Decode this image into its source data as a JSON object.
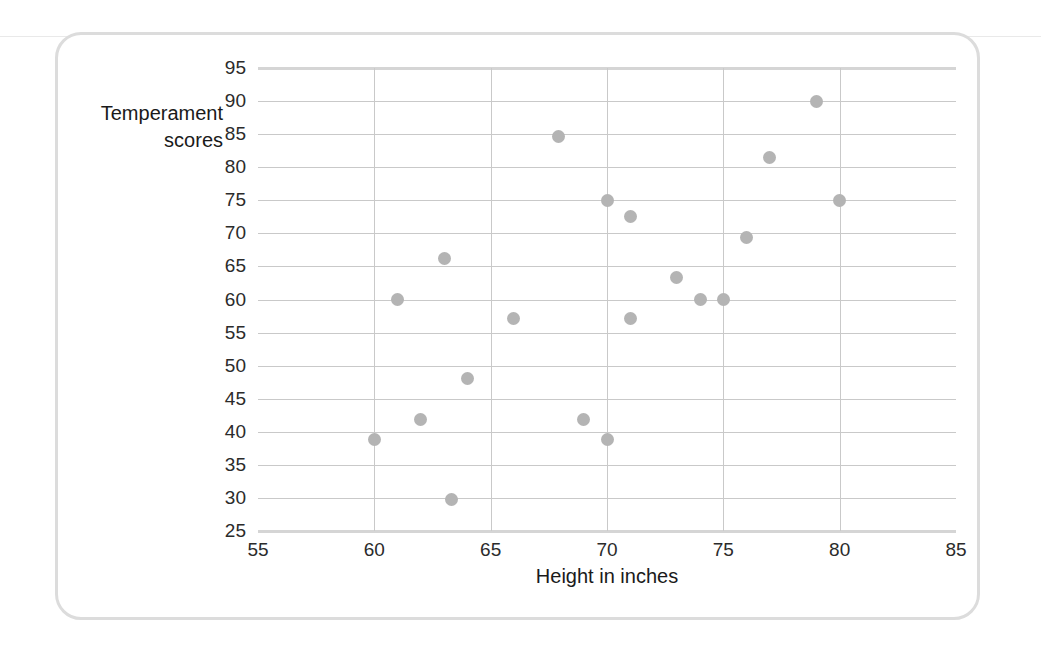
{
  "figure": {
    "ylabel_line1": "Temperament",
    "ylabel_line2": "scores",
    "xlabel": "Height in inches"
  },
  "colors": {
    "point": "#b4b4b4",
    "gridline": "#c9c9c9",
    "axis_edge": "#d5d5d5",
    "card_border": "#dcdcdc",
    "tick_text": "#2b2b2b",
    "label_text": "#1a1a1a"
  },
  "chart_data": {
    "type": "scatter",
    "title": "",
    "xlabel": "Height in inches",
    "ylabel": "Temperament scores",
    "xlim": [
      55,
      85
    ],
    "ylim": [
      25,
      95
    ],
    "xticks": [
      55,
      60,
      65,
      70,
      75,
      80,
      85
    ],
    "yticks": [
      25,
      30,
      35,
      40,
      45,
      50,
      55,
      60,
      65,
      70,
      75,
      80,
      85,
      90,
      95
    ],
    "grid": "both",
    "legend": "none",
    "x": [
      60,
      61,
      62,
      63,
      63.3,
      64,
      66,
      67.9,
      69,
      70,
      70,
      71,
      71,
      73,
      74,
      75,
      76,
      77,
      79,
      80
    ],
    "y": [
      38.8,
      60,
      41.9,
      66.2,
      29.7,
      48,
      57.2,
      84.7,
      41.9,
      75,
      38.8,
      72.5,
      57.2,
      63.4,
      60,
      60,
      69.4,
      81.5,
      90,
      75
    ],
    "points": [
      {
        "height": 60,
        "score": 38.8
      },
      {
        "height": 61,
        "score": 60
      },
      {
        "height": 62,
        "score": 41.9
      },
      {
        "height": 63,
        "score": 66.2
      },
      {
        "height": 63.3,
        "score": 29.7
      },
      {
        "height": 64,
        "score": 48
      },
      {
        "height": 66,
        "score": 57.2
      },
      {
        "height": 67.9,
        "score": 84.7
      },
      {
        "height": 69,
        "score": 41.9
      },
      {
        "height": 70,
        "score": 75
      },
      {
        "height": 70,
        "score": 38.8
      },
      {
        "height": 71,
        "score": 72.5
      },
      {
        "height": 71,
        "score": 57.2
      },
      {
        "height": 73,
        "score": 63.4
      },
      {
        "height": 74,
        "score": 60
      },
      {
        "height": 75,
        "score": 60
      },
      {
        "height": 76,
        "score": 69.4
      },
      {
        "height": 77,
        "score": 81.5
      },
      {
        "height": 79,
        "score": 90
      },
      {
        "height": 80,
        "score": 75
      }
    ]
  }
}
